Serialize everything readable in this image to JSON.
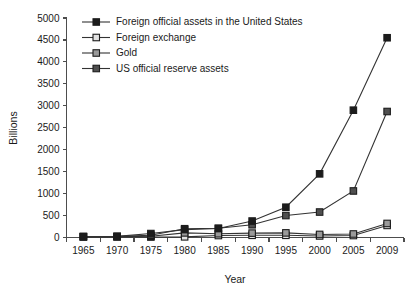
{
  "chart_data": {
    "type": "line",
    "title": "",
    "xlabel": "Year",
    "ylabel": "Billions",
    "categories": [
      "1965",
      "1970",
      "1975",
      "1980",
      "1985",
      "1990",
      "1995",
      "2000",
      "2005",
      "2009"
    ],
    "ylim": [
      0,
      5000
    ],
    "y_ticks": [
      "0",
      "500",
      "1000",
      "1500",
      "2000",
      "2500",
      "3000",
      "3500",
      "4000",
      "4500",
      "5000"
    ],
    "y_tick_values": [
      0,
      500,
      1000,
      1500,
      2000,
      2500,
      3000,
      3500,
      4000,
      4500,
      5000
    ],
    "grid": false,
    "legend_position": "upper-left-inside",
    "series": [
      {
        "name": "Foreign official assets in the United States",
        "color": "#1c1c1c",
        "marker": "square",
        "values": [
          20,
          25,
          90,
          180,
          205,
          375,
          690,
          1450,
          2900,
          4550
        ]
      },
      {
        "name": "Foreign exchange",
        "color": "#e2e2e2",
        "marker": "square",
        "values": [
          15,
          15,
          10,
          15,
          45,
          50,
          50,
          35,
          45,
          275
        ]
      },
      {
        "name": "Gold",
        "color": "#9a9a9a",
        "marker": "square",
        "values": [
          20,
          20,
          30,
          105,
          85,
          100,
          105,
          70,
          80,
          320
        ]
      },
      {
        "name": "US official reserve assets",
        "color": "#4f4f4f",
        "marker": "square",
        "values": [
          20,
          25,
          50,
          200,
          210,
          290,
          500,
          580,
          1060,
          2870
        ]
      }
    ]
  },
  "legend": {
    "entries": [
      {
        "label": "Foreign official assets in the United States"
      },
      {
        "label": "Foreign exchange"
      },
      {
        "label": "Gold"
      },
      {
        "label": "US official reserve assets"
      }
    ]
  },
  "axes": {
    "y_title": "Billions",
    "x_title": "Year"
  },
  "colors": {
    "axis": "#4d4d4d",
    "text": "#1a1a1a",
    "background": "#ffffff",
    "marker_edge": "#1c1c1c"
  }
}
